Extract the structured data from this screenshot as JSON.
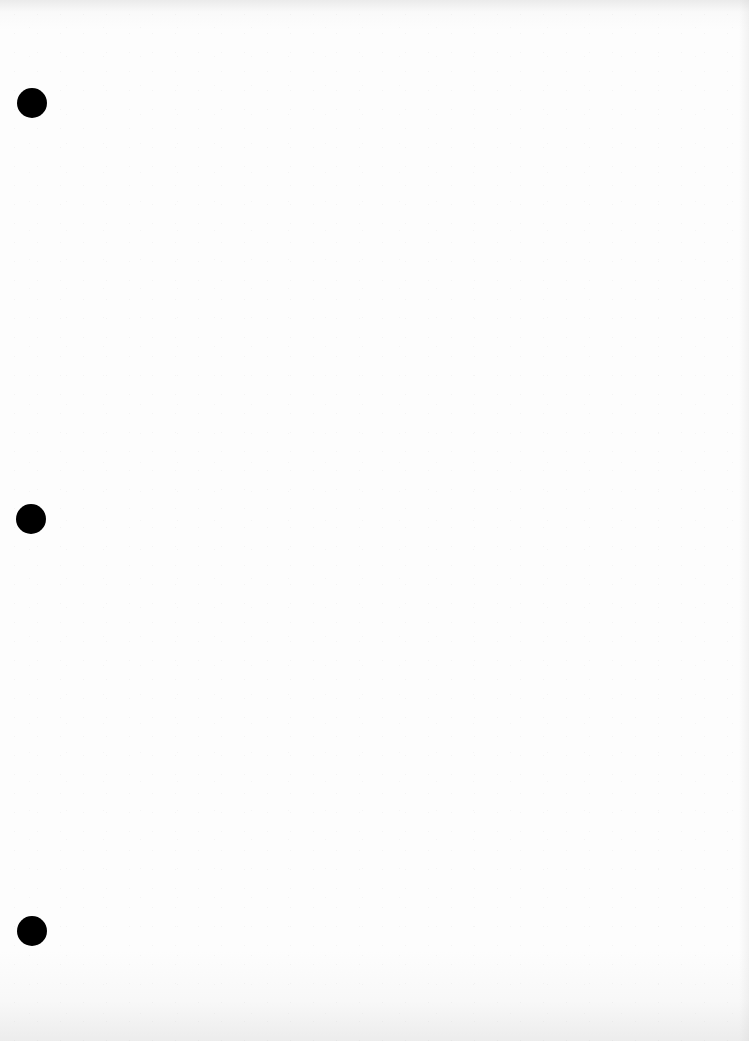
{
  "document": {
    "type": "blank-punched-page",
    "text": "",
    "background_color": "#fdfdfd",
    "punch_holes": [
      {
        "x": 32,
        "y": 103,
        "diameter": 30,
        "color": "#000000"
      },
      {
        "x": 31,
        "y": 519,
        "diameter": 30,
        "color": "#000000"
      },
      {
        "x": 32,
        "y": 931,
        "diameter": 30,
        "color": "#000000"
      }
    ]
  }
}
